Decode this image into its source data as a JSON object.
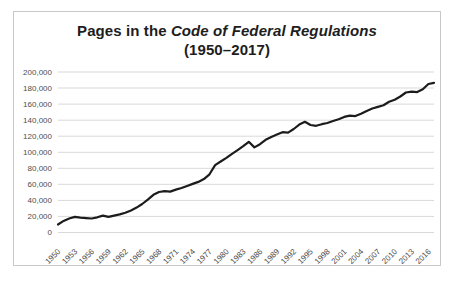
{
  "chart": {
    "title_prefix": "Pages in the ",
    "title_italic": "Code of Federal Regulations",
    "title_line2": "(1950–2017)"
  },
  "chart_data": {
    "type": "line",
    "title": "Pages in the Code of Federal Regulations (1950–2017)",
    "xlabel": "",
    "ylabel": "",
    "ylim": [
      0,
      200000
    ],
    "grid": true,
    "legend": "none",
    "line_color": "#1c1c1c",
    "grid_color": "#d9d9d9",
    "border_color": "#c9c9c9",
    "tick_label_color": "#4d4d4d",
    "title_color": "#1d1d1d",
    "y_ticks": [
      "0",
      "20,000",
      "40,000",
      "60,000",
      "80,000",
      "100,000",
      "120,000",
      "140,000",
      "160,000",
      "180,000",
      "200,000"
    ],
    "x_tick_labels": [
      "1950",
      "1953",
      "1956",
      "1959",
      "1962",
      "1965",
      "1968",
      "1971",
      "1974",
      "1977",
      "1980",
      "1983",
      "1986",
      "1989",
      "1992",
      "1995",
      "1998",
      "2001",
      "2004",
      "2007",
      "2010",
      "2013",
      "2016"
    ],
    "x": [
      1950,
      1951,
      1952,
      1953,
      1954,
      1955,
      1956,
      1957,
      1958,
      1959,
      1960,
      1961,
      1962,
      1963,
      1964,
      1965,
      1966,
      1967,
      1968,
      1969,
      1970,
      1971,
      1972,
      1973,
      1974,
      1975,
      1976,
      1977,
      1978,
      1979,
      1980,
      1981,
      1982,
      1983,
      1984,
      1985,
      1986,
      1987,
      1988,
      1989,
      1990,
      1991,
      1992,
      1993,
      1994,
      1995,
      1996,
      1997,
      1998,
      1999,
      2000,
      2001,
      2002,
      2003,
      2004,
      2005,
      2006,
      2007,
      2008,
      2009,
      2010,
      2011,
      2012,
      2013,
      2014,
      2015,
      2016,
      2017
    ],
    "values": [
      10000,
      14500,
      17500,
      19500,
      18500,
      18000,
      17500,
      19000,
      21000,
      19500,
      21000,
      22500,
      24500,
      27500,
      31000,
      35500,
      41000,
      47000,
      50500,
      51500,
      51000,
      53500,
      55500,
      58000,
      60500,
      63000,
      66500,
      72500,
      84000,
      88500,
      93000,
      98000,
      102500,
      107500,
      113000,
      106000,
      110000,
      115500,
      119000,
      122000,
      125000,
      124500,
      129000,
      134500,
      138000,
      134000,
      133000,
      135000,
      136500,
      139000,
      141000,
      144000,
      145500,
      145000,
      148000,
      151500,
      154500,
      156500,
      158500,
      163000,
      165500,
      169500,
      174500,
      175500,
      175000,
      178500,
      185000,
      186500
    ]
  }
}
